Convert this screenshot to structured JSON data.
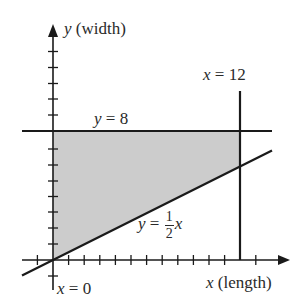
{
  "diagram": {
    "type": "feasible-region-plot",
    "colors": {
      "line": "#1a1a1a",
      "region_fill": "#cccccc",
      "text": "#2a2a2a",
      "background": "#ffffff"
    },
    "axes": {
      "x_label_var": "x",
      "x_label_text": " (length)",
      "y_label_var": "y",
      "y_label_text": " (width)",
      "x_range": [
        -2,
        13
      ],
      "y_range": [
        -1,
        13
      ],
      "tick_spacing": 1
    },
    "lines": [
      {
        "id": "y8",
        "equation": "y = 8",
        "label_var": "y",
        "label_eq": " = 8"
      },
      {
        "id": "x12",
        "equation": "x = 12",
        "label_var": "x",
        "label_eq": " = 12"
      },
      {
        "id": "x0",
        "equation": "x = 0",
        "label_var": "x",
        "label_eq": " = 0"
      },
      {
        "id": "yhalfx",
        "equation": "y = 1/2 x",
        "label_var": "y",
        "label_eq": " = ",
        "frac_num": "1",
        "frac_den": "2",
        "label_tail": "x"
      }
    ],
    "region": {
      "description": "shaded region bounded by x = 0, y = 8, x = 12, y = 1/2 x",
      "vertices": [
        [
          0,
          0
        ],
        [
          0,
          8
        ],
        [
          12,
          8
        ],
        [
          12,
          6
        ]
      ]
    }
  }
}
